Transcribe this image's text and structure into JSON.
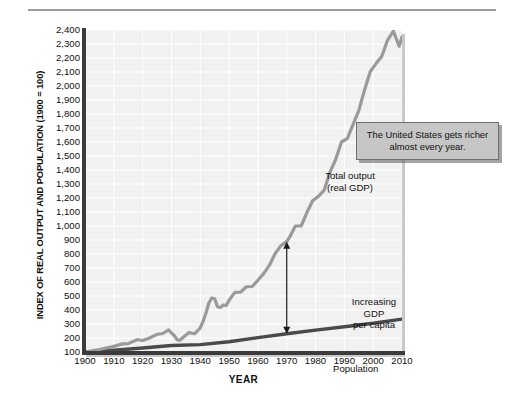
{
  "figure": {
    "y_axis_title": "INDEX OF REAL OUTPUT AND POPULATION (1900 = 100)",
    "x_axis_title": "YEAR",
    "callout_text": "The United States gets richer almost every year.",
    "label_total_output": "Total output\n(real GDP)",
    "label_total_output_line1": "Total output",
    "label_total_output_line2": "(real GDP)",
    "label_increasing_gdp_line1": "Increasing",
    "label_increasing_gdp_line2": "GDP",
    "label_increasing_gdp_line3": "per capita",
    "label_population": "Population",
    "colors": {
      "gdp_line": "#9a9a9a",
      "population_line": "#4a4a4a",
      "plot_background": "#f1f1f1",
      "gridline": "#ffffff",
      "axis": "#3b3b3b",
      "callout_fill": "#c6c6c6",
      "callout_border": "#6e6e6e",
      "page_background": "#ffffff"
    }
  },
  "chart_data": {
    "type": "line",
    "title": "",
    "subtitle": "",
    "xlabel": "YEAR",
    "ylabel": "INDEX OF REAL OUTPUT AND POPULATION (1900 = 100)",
    "xlim": [
      1900,
      2010
    ],
    "ylim": [
      100,
      2400
    ],
    "grid": true,
    "legend_position": "inline-annotations",
    "y_ticks": [
      100,
      200,
      300,
      400,
      500,
      600,
      700,
      800,
      900,
      1000,
      1100,
      1200,
      1300,
      1400,
      1500,
      1600,
      1700,
      1800,
      1900,
      2000,
      2100,
      2200,
      2300,
      2400
    ],
    "y_tick_labels": [
      "100",
      "200",
      "300",
      "400",
      "500",
      "600",
      "700",
      "800",
      "900",
      "1,000",
      "1,100",
      "1,200",
      "1,300",
      "1,400",
      "1,500",
      "1,600",
      "1,700",
      "1,800",
      "1,900",
      "2,000",
      "2,100",
      "2,200",
      "2,300",
      "2,400"
    ],
    "x_ticks": [
      1900,
      1910,
      1920,
      1930,
      1940,
      1950,
      1960,
      1970,
      1980,
      1990,
      2000,
      2010
    ],
    "x_tick_labels": [
      "1900",
      "1910",
      "1920",
      "1930",
      "1940",
      "1950",
      "1960",
      "1970",
      "1980",
      "1990",
      "2000",
      "2010"
    ],
    "series": [
      {
        "name": "Total output (real GDP)",
        "color": "#9a9a9a",
        "x": [
          1900,
          1905,
          1910,
          1913,
          1915,
          1918,
          1920,
          1922,
          1925,
          1927,
          1929,
          1930,
          1931,
          1932,
          1933,
          1934,
          1936,
          1938,
          1939,
          1940,
          1941,
          1942,
          1943,
          1944,
          1945,
          1946,
          1947,
          1948,
          1949,
          1950,
          1952,
          1954,
          1956,
          1958,
          1960,
          1962,
          1964,
          1966,
          1968,
          1970,
          1971,
          1973,
          1975,
          1977,
          1979,
          1981,
          1983,
          1985,
          1987,
          1989,
          1991,
          1993,
          1995,
          1997,
          1999,
          2001,
          2003,
          2005,
          2007,
          2009,
          2010
        ],
        "y": [
          100,
          118,
          140,
          158,
          160,
          188,
          182,
          196,
          226,
          232,
          258,
          236,
          216,
          186,
          184,
          204,
          238,
          230,
          250,
          272,
          320,
          380,
          452,
          486,
          480,
          424,
          418,
          436,
          432,
          470,
          526,
          528,
          566,
          568,
          612,
          660,
          720,
          804,
          860,
          888,
          920,
          1000,
          1000,
          1096,
          1180,
          1212,
          1256,
          1384,
          1476,
          1600,
          1624,
          1724,
          1824,
          1972,
          2104,
          2160,
          2212,
          2328,
          2392,
          2284,
          2350
        ],
        "endpoint_value": 2350
      },
      {
        "name": "Population",
        "color": "#4a4a4a",
        "x": [
          1900,
          1910,
          1920,
          1930,
          1940,
          1950,
          1960,
          1970,
          1980,
          1990,
          2000,
          2010
        ],
        "y": [
          100,
          113,
          129,
          146,
          153,
          173,
          203,
          230,
          256,
          280,
          305,
          335
        ],
        "endpoint_value": 335
      }
    ],
    "annotations": [
      {
        "text": "Total output (real GDP)",
        "x": 1958,
        "y": 1400,
        "type": "series-label"
      },
      {
        "text": "Increasing GDP per capita",
        "x": 1972,
        "y": 600,
        "type": "arrow-label"
      },
      {
        "text": "Population",
        "x": 1972,
        "y": 180,
        "type": "series-label"
      },
      {
        "text": "The United States gets richer almost every year.",
        "x": 1998,
        "y": 1750,
        "type": "callout"
      }
    ],
    "arrow": {
      "x": 1970,
      "y_top": 888,
      "y_bottom": 230,
      "double_headed": true
    }
  }
}
